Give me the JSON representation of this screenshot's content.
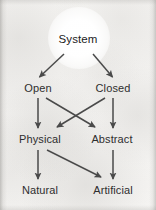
{
  "diagram": {
    "type": "flowchart",
    "background_color": "#f4f3f1",
    "text_color": "#2e2e2e",
    "arrow_color": "#4a4a4a",
    "nodes": [
      {
        "id": "system",
        "label": "System",
        "level": 1,
        "x": 78,
        "y": 40
      },
      {
        "id": "open",
        "label": "Open",
        "level": 2,
        "x": 38,
        "y": 88
      },
      {
        "id": "closed",
        "label": "Closed",
        "level": 2,
        "x": 113,
        "y": 88
      },
      {
        "id": "physical",
        "label": "Physical",
        "level": 3,
        "x": 40,
        "y": 139
      },
      {
        "id": "abstract",
        "label": "Abstract",
        "level": 3,
        "x": 112,
        "y": 139
      },
      {
        "id": "natural",
        "label": "Natural",
        "level": 4,
        "x": 40,
        "y": 190
      },
      {
        "id": "artificial",
        "label": "Artificial",
        "level": 4,
        "x": 113,
        "y": 190
      }
    ],
    "edges": [
      {
        "id": "system-open",
        "from": "System",
        "to": "Open"
      },
      {
        "id": "system-closed",
        "from": "System",
        "to": "Closed"
      },
      {
        "id": "open-physical",
        "from": "Open",
        "to": "Physical"
      },
      {
        "id": "open-abstract",
        "from": "Open",
        "to": "Abstract"
      },
      {
        "id": "closed-physical",
        "from": "Closed",
        "to": "Physical"
      },
      {
        "id": "closed-abstract",
        "from": "Closed",
        "to": "Abstract"
      },
      {
        "id": "physical-natural",
        "from": "Physical",
        "to": "Natural"
      },
      {
        "id": "physical-artificial",
        "from": "Physical",
        "to": "Artificial"
      },
      {
        "id": "abstract-artificial",
        "from": "Abstract",
        "to": "Artificial"
      }
    ]
  }
}
